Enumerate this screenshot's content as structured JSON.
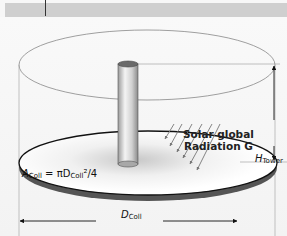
{
  "diagram": {
    "labels": {
      "radiation_line1": "Solar global",
      "radiation_line2": "Radiation G",
      "tower_height_symbol": "H",
      "tower_height_subscript": "Tower",
      "collector_area_symbol": "A",
      "collector_area_subscript": "Coll",
      "collector_area_eq": " = πD",
      "collector_area_sub2": "Coll",
      "collector_area_tail": "²/4",
      "collector_diameter_symbol": "D",
      "collector_diameter_subscript": "Coll"
    },
    "components": [
      "outer cylinder outline",
      "central tower (chimney)",
      "collector disk",
      "solar radiation arrows",
      "height dimension arrow",
      "diameter dimension arrow"
    ],
    "colors": {
      "background": "#f7f7f7",
      "header_bar": "#cfcfcf",
      "line": "#111111",
      "disk_edge": "#555555",
      "tower_fill": "#d8d8d8"
    }
  }
}
